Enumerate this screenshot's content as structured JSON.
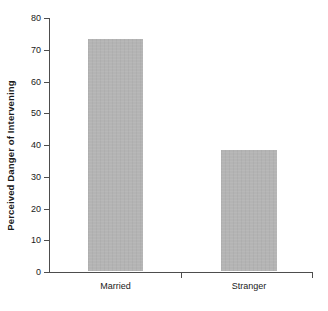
{
  "chart_data": {
    "type": "bar",
    "title": "",
    "subtitle": "",
    "xlabel": "",
    "ylabel": "Perceived Danger of Intervening",
    "categories": [
      "Married",
      "Stranger"
    ],
    "values": [
      73,
      38
    ],
    "series": [
      {
        "name": "Perceived Danger of Intervening",
        "values": [
          73,
          38
        ]
      }
    ],
    "ylim": [
      0,
      80
    ],
    "ytick_step": 10,
    "ytick_labels": [
      "0",
      "10",
      "20",
      "30",
      "40",
      "50",
      "60",
      "70",
      "80"
    ],
    "ytick_values": [
      0,
      10,
      20,
      30,
      40,
      50,
      60,
      70,
      80
    ],
    "grid": false,
    "legend": false,
    "legend_position": "none",
    "bar_color": "#b4b4b4",
    "axis_color": "#4d4d4d",
    "text_color": "#1a1a1a",
    "background": "#ffffff",
    "annotations": []
  }
}
